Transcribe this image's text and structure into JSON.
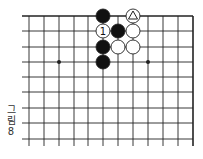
{
  "caption": {
    "line1": "그",
    "line2": "림",
    "line3": "8"
  },
  "board": {
    "columns_x": [
      29,
      44,
      59,
      74,
      88,
      103,
      118,
      133,
      148,
      163,
      178,
      193
    ],
    "rows_y": [
      16,
      31,
      47,
      62,
      77,
      92,
      108,
      123,
      139
    ],
    "edges": [
      "top",
      "right"
    ],
    "line_color": "#222222",
    "star_points": [
      [
        2,
        3
      ],
      [
        8,
        3
      ]
    ],
    "stones": [
      {
        "col": 5,
        "row": 0,
        "color": "black"
      },
      {
        "col": 7,
        "row": 0,
        "color": "white",
        "mark": "triangle"
      },
      {
        "col": 5,
        "row": 1,
        "color": "white",
        "mark": "1"
      },
      {
        "col": 6,
        "row": 1,
        "color": "black"
      },
      {
        "col": 7,
        "row": 1,
        "color": "white"
      },
      {
        "col": 5,
        "row": 2,
        "color": "black"
      },
      {
        "col": 6,
        "row": 2,
        "color": "white"
      },
      {
        "col": 7,
        "row": 2,
        "color": "white"
      },
      {
        "col": 5,
        "row": 3,
        "color": "black"
      }
    ]
  }
}
